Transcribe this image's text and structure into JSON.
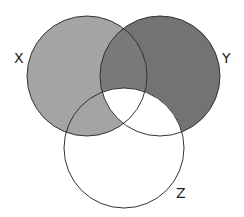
{
  "diagram": {
    "type": "venn-3",
    "sets": [
      {
        "label": "X",
        "cx": 87,
        "cy": 76,
        "r": 60,
        "fill": "#a4a4a4"
      },
      {
        "label": "Y",
        "cx": 160,
        "cy": 76,
        "r": 60,
        "fill": "#737373"
      },
      {
        "label": "Z",
        "cx": 124,
        "cy": 148,
        "r": 60,
        "fill": "#ffffff"
      }
    ],
    "shaded_regions": {
      "X_only": "#a4a4a4",
      "X_and_Z_only": "#a4a4a4",
      "X_and_Y_only": "#7a7a7a",
      "Y_only": "#737373",
      "Y_and_Z_only": "#ffffff",
      "X_Y_Z": "#ffffff",
      "Z_only": "#ffffff"
    },
    "stroke": "#333333",
    "labels": {
      "x": "X",
      "y": "Y",
      "z": "Z"
    }
  }
}
